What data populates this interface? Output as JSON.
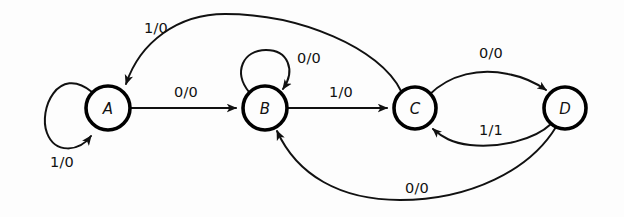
{
  "diagram": {
    "kind": "finite-state-machine-mealy",
    "background_color": "#fdfdfd",
    "stroke_color": "#111111",
    "states": [
      {
        "id": "A",
        "label": "A",
        "cx": 108,
        "cy": 108,
        "r": 22
      },
      {
        "id": "B",
        "label": "B",
        "cx": 265,
        "cy": 108,
        "r": 22
      },
      {
        "id": "C",
        "label": "C",
        "cx": 415,
        "cy": 108,
        "r": 21
      },
      {
        "id": "D",
        "label": "D",
        "cx": 565,
        "cy": 108,
        "r": 21
      }
    ],
    "transitions": [
      {
        "id": "a-self",
        "from": "A",
        "to": "A",
        "label": "1/0",
        "label_x": 62,
        "label_y": 162,
        "shape": "self-loop-left"
      },
      {
        "id": "a-to-b",
        "from": "A",
        "to": "B",
        "label": "0/0",
        "label_x": 186,
        "label_y": 92,
        "shape": "straight"
      },
      {
        "id": "b-self",
        "from": "B",
        "to": "B",
        "label": "0/0",
        "label_x": 309,
        "label_y": 58,
        "shape": "self-loop-top"
      },
      {
        "id": "b-to-c",
        "from": "B",
        "to": "C",
        "label": "1/0",
        "label_x": 341,
        "label_y": 92,
        "shape": "straight"
      },
      {
        "id": "c-to-a",
        "from": "C",
        "to": "A",
        "label": "1/0",
        "label_x": 156,
        "label_y": 28,
        "shape": "arc-over-top"
      },
      {
        "id": "c-to-d",
        "from": "C",
        "to": "D",
        "label": "0/0",
        "label_x": 491,
        "label_y": 53,
        "shape": "arc-upper"
      },
      {
        "id": "d-to-c",
        "from": "D",
        "to": "C",
        "label": "1/1",
        "label_x": 491,
        "label_y": 130,
        "shape": "arc-lower"
      },
      {
        "id": "d-to-b",
        "from": "D",
        "to": "B",
        "label": "0/0",
        "label_x": 417,
        "label_y": 188,
        "shape": "arc-under-bottom"
      }
    ]
  }
}
